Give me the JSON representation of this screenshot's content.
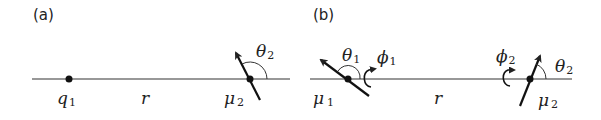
{
  "panels": [
    {
      "id": "a",
      "label": "(a)",
      "charge": {
        "symbol": "q",
        "subscript": "1"
      },
      "distance": "r",
      "dipole": {
        "symbol": "μ",
        "subscript": "2"
      },
      "angle": {
        "symbol": "θ",
        "subscript": "2"
      }
    },
    {
      "id": "b",
      "label": "(b)",
      "dipole1": {
        "symbol": "μ",
        "subscript": "1"
      },
      "angle1": {
        "symbol": "θ",
        "subscript": "1"
      },
      "azimuth1": {
        "symbol": "ϕ",
        "subscript": "1"
      },
      "distance": "r",
      "dipole2": {
        "symbol": "μ",
        "subscript": "2"
      },
      "angle2": {
        "symbol": "θ",
        "subscript": "2"
      },
      "azimuth2": {
        "symbol": "ϕ",
        "subscript": "2"
      }
    }
  ],
  "colors": {
    "ink": "#222222",
    "line": "#333333",
    "background": "#ffffff"
  }
}
